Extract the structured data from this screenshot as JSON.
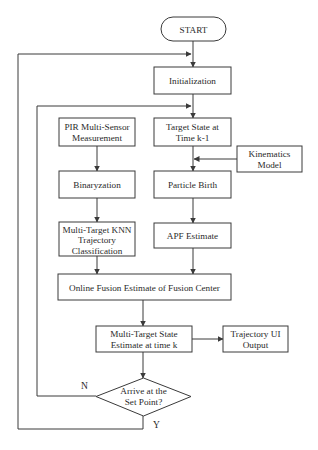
{
  "diagram": {
    "type": "flowchart",
    "nodes": {
      "start": {
        "shape": "terminal",
        "lines": [
          "START"
        ]
      },
      "init": {
        "shape": "process",
        "lines": [
          "Initialization"
        ]
      },
      "pir": {
        "shape": "process",
        "lines": [
          "PIR Multi-Sensor",
          "Measurement"
        ]
      },
      "target_state": {
        "shape": "process",
        "lines": [
          "Target State at",
          "Time k-1"
        ]
      },
      "kinematics": {
        "shape": "process",
        "lines": [
          "Kinematics",
          "Model"
        ]
      },
      "binary": {
        "shape": "process",
        "lines": [
          "Binaryzation"
        ]
      },
      "particle": {
        "shape": "process",
        "lines": [
          "Particle Birth"
        ]
      },
      "knn": {
        "shape": "process",
        "lines": [
          "Multi-Target KNN",
          "Trajectory",
          "Classification"
        ]
      },
      "apf": {
        "shape": "process",
        "lines": [
          "APF Estimate"
        ]
      },
      "fusion": {
        "shape": "process",
        "lines": [
          "Online Fusion Estimate of Fusion Center"
        ]
      },
      "mt_state": {
        "shape": "process",
        "lines": [
          "Multi-Target State",
          "Estimate at time k"
        ]
      },
      "traj_ui": {
        "shape": "process",
        "lines": [
          "Trajectory UI",
          "Output"
        ]
      },
      "decision": {
        "shape": "decision",
        "lines": [
          "Arrive at the",
          "Set Point?"
        ]
      }
    },
    "edge_labels": {
      "no": "N",
      "yes": "Y"
    },
    "edges": [
      [
        "start",
        "init"
      ],
      [
        "init",
        "target_state"
      ],
      [
        "pir",
        "binary"
      ],
      [
        "binary",
        "knn"
      ],
      [
        "target_state",
        "particle"
      ],
      [
        "kinematics",
        "particle"
      ],
      [
        "particle",
        "apf"
      ],
      [
        "knn",
        "fusion"
      ],
      [
        "apf",
        "fusion"
      ],
      [
        "fusion",
        "mt_state"
      ],
      [
        "mt_state",
        "traj_ui"
      ],
      [
        "mt_state",
        "decision"
      ],
      [
        "decision",
        "target_state",
        "N"
      ],
      [
        "decision",
        "init",
        "Y"
      ]
    ]
  }
}
